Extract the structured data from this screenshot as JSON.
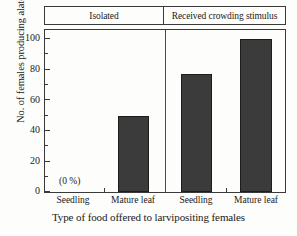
{
  "chart_data": {
    "type": "bar",
    "title": "",
    "xlabel": "Type of food offered to larvipositing females",
    "ylabel": "No. of females producing alate offspring (%)",
    "ylim": [
      0,
      105
    ],
    "yticks": [
      0,
      20,
      40,
      60,
      80,
      100
    ],
    "ytick_labels": [
      "0",
      "20",
      "40",
      "60",
      "80",
      "100"
    ],
    "minor_yticks": [
      10,
      30,
      50,
      70,
      90
    ],
    "grid": false,
    "legend": "none",
    "groups": [
      {
        "label": "Isolated"
      },
      {
        "label": "Received crowding stimulus"
      }
    ],
    "categories": [
      "Seedling",
      "Mature leaf",
      "Seedling",
      "Mature leaf"
    ],
    "values": [
      0,
      50,
      77,
      100
    ],
    "annotations": [
      {
        "text": "(0 %)",
        "category_index": 0
      }
    ]
  },
  "colors": {
    "bar_fill": "#3b3b3b",
    "bar_edge": "#1d1d1d",
    "axis": "#3a3a3a",
    "background": "#fdfdfb"
  }
}
